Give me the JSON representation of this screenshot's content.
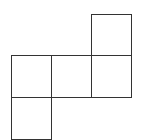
{
  "diagram": {
    "type": "cube-net",
    "stroke_color": "#333333",
    "background": "#ffffff",
    "cell_size": 40,
    "faces": [
      {
        "id": "top-right",
        "x": 91,
        "y": 14,
        "w": 40,
        "h": 41
      },
      {
        "id": "middle-left",
        "x": 11,
        "y": 55,
        "w": 40,
        "h": 42
      },
      {
        "id": "middle-center",
        "x": 51,
        "y": 55,
        "w": 40,
        "h": 42
      },
      {
        "id": "middle-right",
        "x": 91,
        "y": 55,
        "w": 40,
        "h": 42
      },
      {
        "id": "bottom-left",
        "x": 11,
        "y": 97,
        "w": 40,
        "h": 42
      }
    ]
  }
}
